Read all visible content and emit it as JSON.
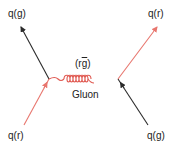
{
  "diagram": {
    "type": "feynman-diagram",
    "colors": {
      "red_quark": "#e8766e",
      "green_quark": "#2b2b2b",
      "gluon": "#e05a52",
      "text": "#222222",
      "background": "#ffffff"
    },
    "labels": {
      "top_left": "q(g)",
      "top_right": "q(r)",
      "bottom_left": "q(r)",
      "bottom_right": "q(g)",
      "gluon_color_prefix": "(r",
      "gluon_color_bar": "g",
      "gluon_color_suffix": ")",
      "gluon_name": "Gluon"
    },
    "lines": [
      {
        "id": "incoming-left",
        "color": "red",
        "from": [
          24,
          125
        ],
        "to": [
          49,
          79
        ],
        "label": "q(r)"
      },
      {
        "id": "outgoing-left",
        "color": "black",
        "from": [
          49,
          79
        ],
        "to": [
          21,
          27
        ],
        "label": "q(g)"
      },
      {
        "id": "incoming-right",
        "color": "black",
        "from": [
          148,
          125
        ],
        "to": [
          118,
          79
        ],
        "label": "q(g)"
      },
      {
        "id": "outgoing-right",
        "color": "red",
        "from": [
          118,
          79
        ],
        "to": [
          157,
          27
        ],
        "label": "q(r)"
      },
      {
        "id": "gluon",
        "color": "red",
        "from": [
          49,
          79
        ],
        "to": [
          118,
          79
        ],
        "label": "Gluon (rḡ)",
        "style": "coil"
      }
    ]
  }
}
